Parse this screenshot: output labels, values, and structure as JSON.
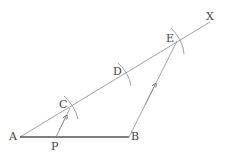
{
  "diagram": {
    "type": "geometric-construction",
    "colors": {
      "stroke": "#888888",
      "segment_ab": "#555555",
      "text": "#444444"
    },
    "points": {
      "A": {
        "label": "A",
        "x": 20,
        "y": 137
      },
      "B": {
        "label": "B",
        "x": 129,
        "y": 137
      },
      "P": {
        "label": "P",
        "x": 56,
        "y": 137
      },
      "C": {
        "label": "C",
        "x": 70,
        "y": 107
      },
      "D": {
        "label": "D",
        "x": 124,
        "y": 75
      },
      "E": {
        "label": "E",
        "x": 177,
        "y": 41
      },
      "X": {
        "label": "X",
        "x": 203,
        "y": 25
      }
    },
    "segments": [
      {
        "from": "A",
        "to": "B",
        "style": "bold"
      },
      {
        "from": "A",
        "to": "X",
        "style": "ray"
      },
      {
        "from": "B",
        "to": "E",
        "style": "arrow"
      },
      {
        "from": "P",
        "to": "C",
        "style": "arrow"
      }
    ],
    "arcs": [
      "C",
      "D",
      "E"
    ]
  }
}
